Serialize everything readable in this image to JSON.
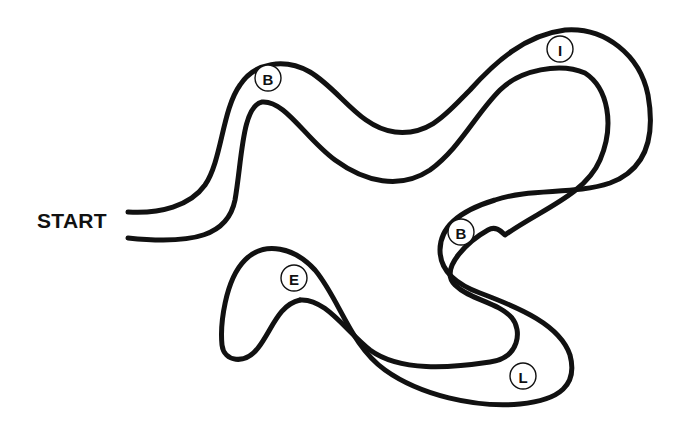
{
  "diagram": {
    "type": "maze-path",
    "start_label": "START",
    "colors": {
      "line": "#111111",
      "background": "#ffffff"
    },
    "markers": [
      {
        "letter": "B",
        "x": 268,
        "y": 78
      },
      {
        "letter": "I",
        "x": 560,
        "y": 49
      },
      {
        "letter": "B",
        "x": 461,
        "y": 232
      },
      {
        "letter": "E",
        "x": 294,
        "y": 278
      },
      {
        "letter": "L",
        "x": 523,
        "y": 376
      }
    ],
    "marker_sequence": "B-I-B-L-E"
  }
}
